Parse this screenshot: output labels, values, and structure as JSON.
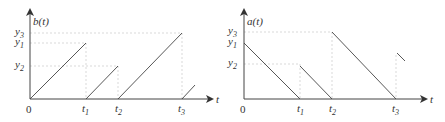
{
  "left_plot": {
    "ylabel": "b(t)",
    "xlabel": "t",
    "origin_label": "0",
    "y_ticks": [
      {
        "base": "y",
        "sub": "3"
      },
      {
        "base": "y",
        "sub": "1"
      },
      {
        "base": "y",
        "sub": "2"
      }
    ],
    "x_ticks": [
      {
        "base": "t",
        "sub": "1"
      },
      {
        "base": "t",
        "sub": "2"
      },
      {
        "base": "t",
        "sub": "3"
      }
    ],
    "shape": "rising sawtooth"
  },
  "right_plot": {
    "ylabel": "a(t)",
    "xlabel": "t",
    "origin_label": "0",
    "y_ticks": [
      {
        "base": "y",
        "sub": "3"
      },
      {
        "base": "y",
        "sub": "1"
      },
      {
        "base": "y",
        "sub": "2"
      }
    ],
    "x_ticks": [
      {
        "base": "t",
        "sub": "1"
      },
      {
        "base": "t",
        "sub": "2"
      },
      {
        "base": "t",
        "sub": "3"
      }
    ],
    "shape": "falling sawtooth"
  },
  "colors": {
    "line": "#444444",
    "axis": "#555555",
    "guide": "#cccccc"
  }
}
